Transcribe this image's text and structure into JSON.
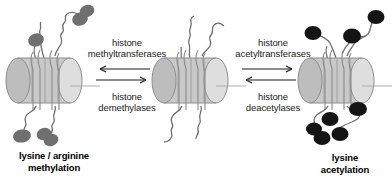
{
  "figure": {
    "background_color": "#ffffff",
    "nucleosome_fill": "#c9c9c9",
    "nucleosome_face_fill": "#dcdcdc",
    "nucleosome_stroke": "#8c8c8c",
    "tail_stroke": "#6e6e6e",
    "methyl_mark_color": "#6f6f6f",
    "acetyl_mark_color": "#141414"
  },
  "nucleosomes": [
    {
      "id": "nucleosome-methylated",
      "state_label": {
        "line1": "lysine / arginine",
        "line2": "methylation"
      },
      "mark_type": "methyl",
      "mark_color": "#6f6f6f",
      "mark_count": 6
    },
    {
      "id": "nucleosome-unmodified",
      "state_label": {
        "line1": "",
        "line2": ""
      },
      "mark_type": "none",
      "mark_color": "",
      "mark_count": 0
    },
    {
      "id": "nucleosome-acetylated",
      "state_label": {
        "line1": "lysine",
        "line2": "acetylation"
      },
      "mark_type": "acetyl",
      "mark_color": "#141414",
      "mark_count": 8
    }
  ],
  "reactions": [
    {
      "id": "reaction-methylation",
      "forward": {
        "label_line1": "histone",
        "label_line2": "methyltransferases",
        "direction": "left"
      },
      "reverse": {
        "label_line1": "histone",
        "label_line2": "demethylases",
        "direction": "right"
      }
    },
    {
      "id": "reaction-acetylation",
      "forward": {
        "label_line1": "histone",
        "label_line2": "acetyltransferases",
        "direction": "right"
      },
      "reverse": {
        "label_line1": "histone",
        "label_line2": "deacetylases",
        "direction": "left"
      }
    }
  ]
}
